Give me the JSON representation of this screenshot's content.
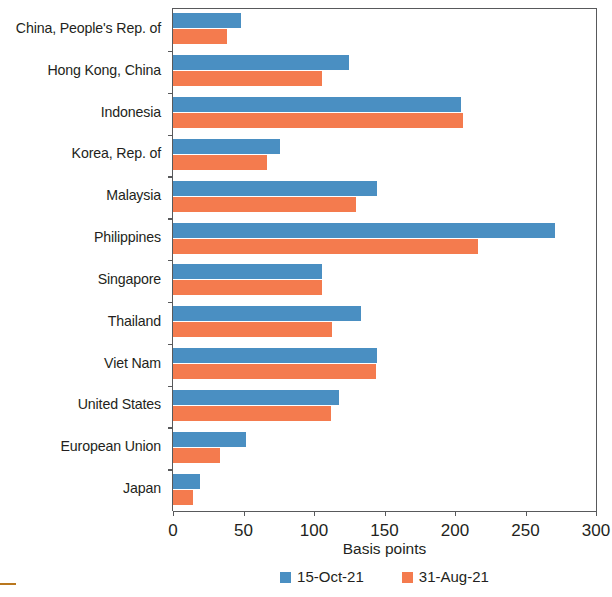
{
  "chart_data": {
    "type": "bar",
    "orientation": "horizontal",
    "title": "",
    "subtitle": "",
    "xlabel": "Basis points",
    "ylabel": "",
    "xlim": [
      0,
      300
    ],
    "xticks": [
      0,
      50,
      100,
      150,
      200,
      250,
      300
    ],
    "grid": false,
    "legend_position": "bottom-center",
    "categories": [
      "China, People's Rep. of",
      "Hong Kong, China",
      "Indonesia",
      "Korea, Rep. of",
      "Malaysia",
      "Philippines",
      "Singapore",
      "Thailand",
      "Viet Nam",
      "United States",
      "European Union",
      "Japan"
    ],
    "series": [
      {
        "name": "15-Oct-21",
        "color": "#4a8fc2",
        "values": [
          48,
          125,
          204,
          76,
          145,
          271,
          106,
          133,
          145,
          118,
          52,
          19
        ]
      },
      {
        "name": "31-Aug-21",
        "color": "#f47b4e",
        "values": [
          38,
          106,
          206,
          67,
          130,
          216,
          106,
          113,
          144,
          112,
          33,
          14
        ]
      }
    ]
  },
  "legend": {
    "items": [
      {
        "label": "15-Oct-21",
        "color": "#4a8fc2"
      },
      {
        "label": "31-Aug-21",
        "color": "#f47b4e"
      }
    ]
  },
  "axis": {
    "x_title": "Basis points"
  }
}
